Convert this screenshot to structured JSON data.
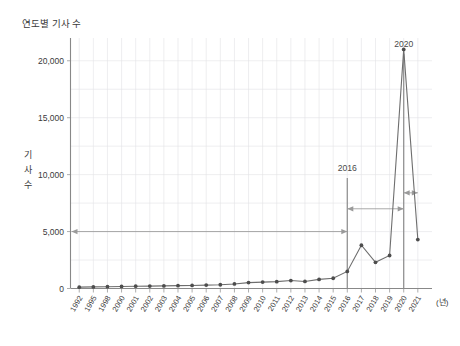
{
  "chart_data": {
    "type": "line",
    "title": "연도별 기사 수",
    "xlabel": "(년)",
    "ylabel": "기 사 수",
    "ylabel_chars": [
      "기",
      "사",
      "수"
    ],
    "categories": [
      "1992",
      "1995",
      "1998",
      "2000",
      "2001",
      "2002",
      "2003",
      "2004",
      "2005",
      "2006",
      "2007",
      "2008",
      "2009",
      "2010",
      "2011",
      "2012",
      "2013",
      "2014",
      "2015",
      "2016",
      "2017",
      "2018",
      "2019",
      "2020",
      "2021"
    ],
    "values": [
      120,
      140,
      160,
      180,
      200,
      210,
      230,
      250,
      270,
      300,
      330,
      400,
      520,
      560,
      600,
      700,
      620,
      800,
      900,
      1500,
      3800,
      2300,
      2900,
      21000,
      4300
    ],
    "ylim": [
      0,
      22000
    ],
    "yticks": [
      0,
      5000,
      10000,
      15000,
      20000
    ],
    "ytick_labels": [
      "0",
      "5,000",
      "10,000",
      "15,000",
      "20,000"
    ],
    "grid": true,
    "legend": "none",
    "annotations": [
      {
        "name": "marker-2016",
        "label": "2016",
        "year": "2016"
      },
      {
        "name": "marker-2020",
        "label": "2020",
        "year": "2020"
      }
    ],
    "span_arrows": [
      {
        "name": "span-arrow-long",
        "from": "axis",
        "to": "2016",
        "level": 5000
      },
      {
        "name": "span-arrow-mid",
        "from": "2016",
        "to": "2020",
        "level": 7000
      },
      {
        "name": "span-arrow-short",
        "from": "2020",
        "to": "2021",
        "level": 8400
      }
    ]
  }
}
